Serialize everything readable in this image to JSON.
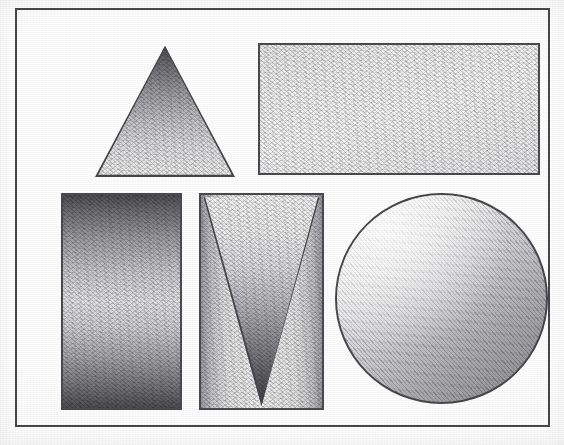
{
  "artwork": {
    "title": "Shaded Geometric Shapes Study",
    "medium": "graphite pencil on textured paper (scanned)",
    "canvas": {
      "width": 564,
      "height": 445,
      "background_hex": "#fefefe"
    },
    "frame": {
      "name": "border-frame",
      "x": 15,
      "y": 8,
      "width": 535,
      "height": 419,
      "stroke_hex": "#4a4a4c",
      "stroke_width": 2
    }
  },
  "palette": {
    "paper_hex": "#fdfdfd",
    "outline_hex": "#4a4a4e",
    "darkest_hex": "#3d3d41",
    "midtone_hex": "#9a9a9e",
    "lightest_hex": "#f6f6f6"
  },
  "shapes": [
    {
      "id": "triangle-up",
      "label": "Upward Triangle",
      "type": "triangle",
      "orientation": "point-up",
      "x": 78,
      "y": 36,
      "width": 140,
      "height": 131,
      "shading": "vertical gradient, dark at apex fading to light at base",
      "gradient_direction": "top-to-bottom",
      "value_start_hex": "#4c4c50",
      "value_end_hex": "#efefef"
    },
    {
      "id": "rectangle-top",
      "label": "Wide Top Rectangle",
      "type": "rectangle",
      "x": 241,
      "y": 33,
      "width": 282,
      "height": 132,
      "shading": "even pale tone with slight diagonal grain",
      "gradient_direction": "diagonal",
      "value_start_hex": "#e9e9ea",
      "value_end_hex": "#f6f6f6"
    },
    {
      "id": "rectangle-left",
      "label": "Tall Left Rectangle",
      "type": "rectangle",
      "x": 44,
      "y": 183,
      "width": 121,
      "height": 217,
      "shading": "dark at top and bottom edges, light through the middle band",
      "gradient_direction": "top-to-bottom",
      "value_start_hex": "#4e4e52",
      "value_mid_hex": "#e2e2e3",
      "value_end_hex": "#4d4d51"
    },
    {
      "id": "rectangle-middle",
      "label": "Middle Rectangle",
      "type": "rectangle",
      "x": 182,
      "y": 183,
      "width": 125,
      "height": 217,
      "shading": "light center with darker left and right edges",
      "gradient_direction": "left-to-right",
      "value_start_hex": "#9d9da1",
      "value_mid_hex": "#f0f0f1",
      "value_end_hex": "#9d9da1"
    },
    {
      "id": "triangle-down",
      "label": "Inverted Triangle",
      "type": "triangle",
      "orientation": "point-down",
      "contained_in": "rectangle-middle",
      "x": 184,
      "y": 185,
      "width": 121,
      "height": 213,
      "shading": "light along the top edge darkening toward the lower apex",
      "gradient_direction": "top-to-bottom",
      "value_start_hex": "#f4f4f4",
      "value_end_hex": "#3d3d41"
    },
    {
      "id": "circle",
      "label": "Circle",
      "type": "circle",
      "x": 318,
      "y": 183,
      "width": 213,
      "height": 211,
      "center_x": 424,
      "center_y": 288,
      "radius": 106,
      "shading": "diagonal gradient, highlight in upper-left falling to shadow in lower-right",
      "gradient_direction": "upper-left to lower-right",
      "value_start_hex": "#fbfbfb",
      "value_end_hex": "#909094"
    }
  ],
  "counts": {
    "total_shapes": 6,
    "triangles": 2,
    "rectangles": 3,
    "circles": 1
  }
}
